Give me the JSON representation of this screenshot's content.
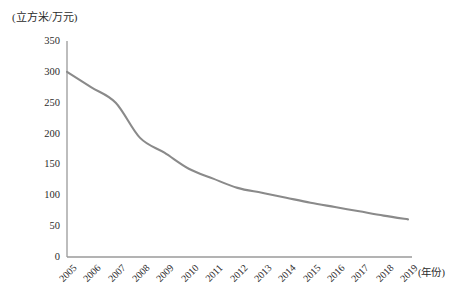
{
  "chart_data": {
    "type": "line",
    "title": "",
    "subtitle": "",
    "xlabel": "(年份)",
    "ylabel": "(立方米/万元)",
    "unit_label": "(立方米/万元)",
    "x": [
      "2005",
      "2006",
      "2007",
      "2008",
      "2009",
      "2010",
      "2011",
      "2012",
      "2013",
      "2014",
      "2015",
      "2016",
      "2017",
      "2018",
      "2019"
    ],
    "categories": [
      "2005",
      "2006",
      "2007",
      "2008",
      "2009",
      "2010",
      "2011",
      "2012",
      "2013",
      "2014",
      "2015",
      "2016",
      "2017",
      "2018",
      "2019"
    ],
    "values": [
      300,
      275,
      250,
      193,
      169,
      143,
      127,
      112,
      104,
      96,
      88,
      81,
      74,
      67,
      61
    ],
    "series": [
      {
        "name": "万元GDP用水量",
        "values": [
          300,
          275,
          250,
          193,
          169,
          143,
          127,
          112,
          104,
          96,
          88,
          81,
          74,
          67,
          61
        ]
      }
    ],
    "yticks": [
      0,
      50,
      100,
      150,
      200,
      250,
      300,
      350
    ],
    "ytick_labels": [
      "0",
      "50",
      "100",
      "150",
      "200",
      "250",
      "300",
      "350"
    ],
    "ylim": [
      0,
      350
    ],
    "xlim": [
      "2005",
      "2019"
    ],
    "grid": false,
    "legend": false,
    "legend_position": "none",
    "line_color": "#8a8a8a",
    "axis_color": "#9a9a9a",
    "text_color": "#2b2b2b",
    "annotations": []
  }
}
